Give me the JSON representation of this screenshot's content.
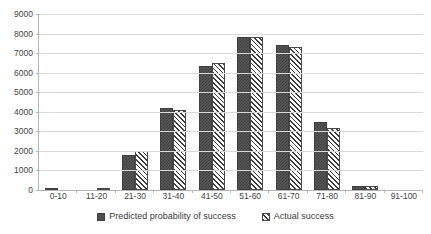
{
  "chart_data": {
    "type": "bar",
    "title": "",
    "subtitle": "",
    "xlabel": "",
    "ylabel": "",
    "categories": [
      "0-10",
      "11-20",
      "21-30",
      "31-40",
      "41-50",
      "51-60",
      "61-70",
      "71-80",
      "81-90",
      "91-100"
    ],
    "series": [
      {
        "name": "Predicted probability of success",
        "values": [
          20,
          0,
          1800,
          4200,
          6350,
          7800,
          7400,
          3500,
          230,
          0
        ]
      },
      {
        "name": "Actual success",
        "values": [
          0,
          100,
          2000,
          4100,
          6500,
          7800,
          7300,
          3150,
          200,
          0
        ]
      }
    ],
    "ylim": [
      0,
      9000
    ],
    "ytick_values": [
      0,
      1000,
      2000,
      3000,
      4000,
      5000,
      6000,
      7000,
      8000,
      9000
    ],
    "ytick_labels": [
      "0",
      "1000",
      "2000",
      "3000",
      "4000",
      "5000",
      "6000",
      "7000",
      "8000",
      "9000"
    ],
    "grid": true,
    "legend_position": "bottom",
    "colors": {
      "predicted_fill": "#5a5a5a",
      "predicted_pattern": "#3b3b3b",
      "actual_fill": "#ffffff",
      "actual_pattern": "#3d3d3d",
      "gridline": "#d9d9d9",
      "axis": "#b6b6b6",
      "text": "#3a3a3a",
      "background": "#ffffff"
    }
  },
  "legend": {
    "entries": [
      {
        "label": "Predicted probability of success",
        "swatch": "checkered-swatch"
      },
      {
        "label": "Actual success",
        "swatch": "hatched-swatch"
      }
    ]
  }
}
